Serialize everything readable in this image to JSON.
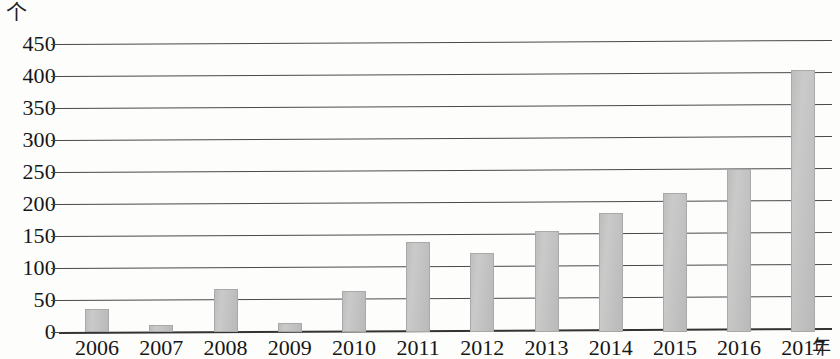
{
  "chart_data": {
    "type": "bar",
    "title": "",
    "subtitle": "",
    "xlabel": "年",
    "ylabel": "个",
    "categories": [
      "2006",
      "2007",
      "2008",
      "2009",
      "2010",
      "2011",
      "2012",
      "2013",
      "2014",
      "2015",
      "2016",
      "2017"
    ],
    "values": [
      36,
      11,
      67,
      14,
      64,
      140,
      123,
      158,
      186,
      217,
      255,
      410
    ],
    "series": [
      {
        "name": "",
        "values": [
          36,
          11,
          67,
          14,
          64,
          140,
          123,
          158,
          186,
          217,
          255,
          410
        ]
      }
    ],
    "ylim": [
      0,
      450
    ],
    "ytick_step": 50,
    "yticks": [
      "450",
      "400",
      "350",
      "300",
      "250",
      "200",
      "150",
      "100",
      "50",
      "0"
    ],
    "ytick_values": [
      450,
      400,
      350,
      300,
      250,
      200,
      150,
      100,
      50,
      0
    ],
    "grid": true,
    "grid_axis": "y",
    "legend": null,
    "legend_position": "none",
    "bar_color": "#c3c3c3",
    "bar_border_color": "#a9a9a9",
    "gridline_color": "#4a4a4a",
    "axis_color": "#333333",
    "text_color": "#161616",
    "background_color": "#fdfdfc"
  },
  "axes": {
    "y_unit_label": "个",
    "x_unit_label": "年"
  }
}
